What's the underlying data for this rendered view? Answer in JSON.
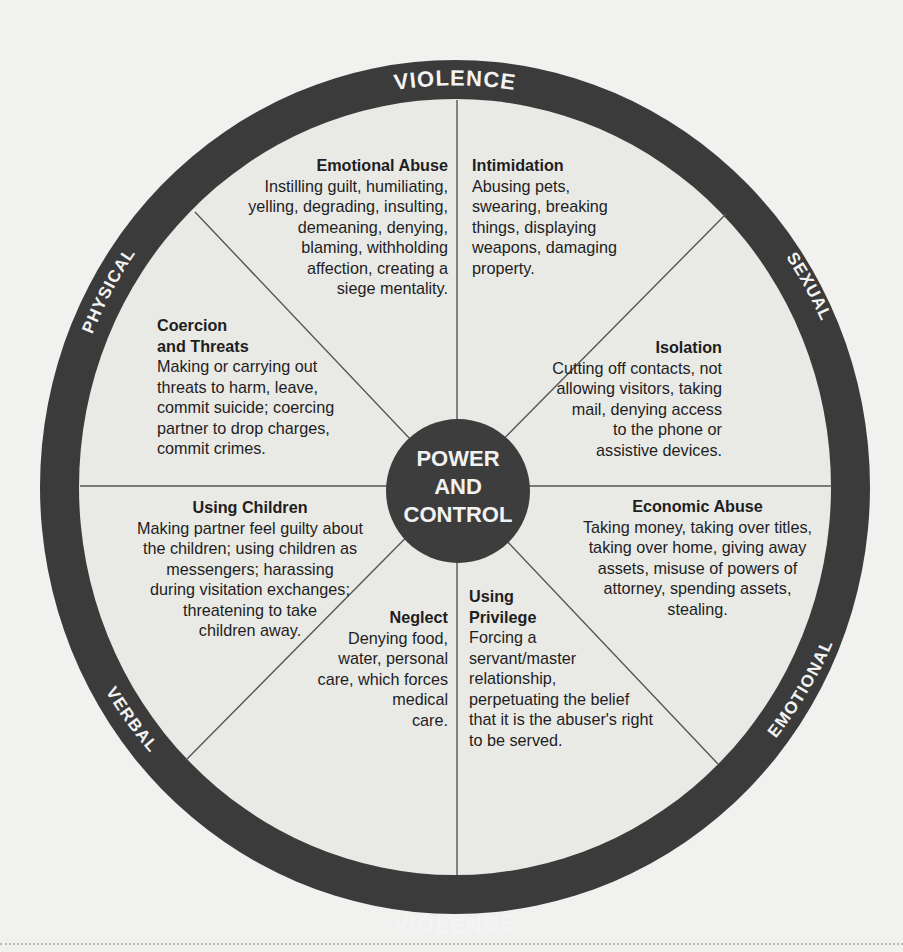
{
  "diagram": {
    "type": "power-and-control-wheel",
    "colors": {
      "background": "#f1f1ef",
      "ring": "#3b3b3b",
      "wheel_fill": "#e9e9e6",
      "hub": "#3d3d3d",
      "spoke": "#555555",
      "ring_text": "#f4f4f4",
      "body_text": "#1e1e1e"
    },
    "ring_labels": {
      "top": "VIOLENCE",
      "bottom": "VIOLENCE",
      "upper_left": "PHYSICAL",
      "upper_right": "SEXUAL",
      "lower_left": "VERBAL",
      "lower_right": "EMOTIONAL"
    },
    "hub": {
      "line1": "POWER",
      "line2": "AND",
      "line3": "CONTROL"
    },
    "segments": [
      {
        "id": "emotional-abuse",
        "title": "Emotional Abuse",
        "body": "Instilling guilt, humiliating,\nyelling, degrading, insulting,\ndemeaning, denying,\nblaming, withholding\naffection, creating a\nsiege mentality."
      },
      {
        "id": "intimidation",
        "title": "Intimidation",
        "body": "Abusing pets,\nswearing, breaking\nthings, displaying\nweapons, damaging\nproperty."
      },
      {
        "id": "isolation",
        "title": "Isolation",
        "body": "Cutting off contacts, not\nallowing visitors, taking\nmail, denying access\nto the phone or\nassistive devices."
      },
      {
        "id": "economic-abuse",
        "title": "Economic Abuse",
        "body": "Taking money, taking over titles,\ntaking over home, giving away\nassets, misuse of powers of\nattorney, spending assets,\nstealing."
      },
      {
        "id": "using-privilege",
        "title": "Using\nPrivilege",
        "body": "Forcing a\nservant/master\nrelationship,\nperpetuating the belief\nthat it is the abuser's right\nto be served."
      },
      {
        "id": "neglect",
        "title": "Neglect",
        "body": "Denying food,\nwater, personal\ncare, which forces\nmedical\ncare."
      },
      {
        "id": "using-children",
        "title": "Using Children",
        "body": "Making partner feel guilty about\nthe children; using children as\nmessengers; harassing\nduring visitation exchanges;\nthreatening to take\nchildren away."
      },
      {
        "id": "coercion-and-threats",
        "title": "Coercion\nand Threats",
        "body": "Making or carrying out\nthreats to harm, leave,\ncommit suicide; coercing\npartner to drop charges,\ncommit crimes."
      }
    ]
  }
}
